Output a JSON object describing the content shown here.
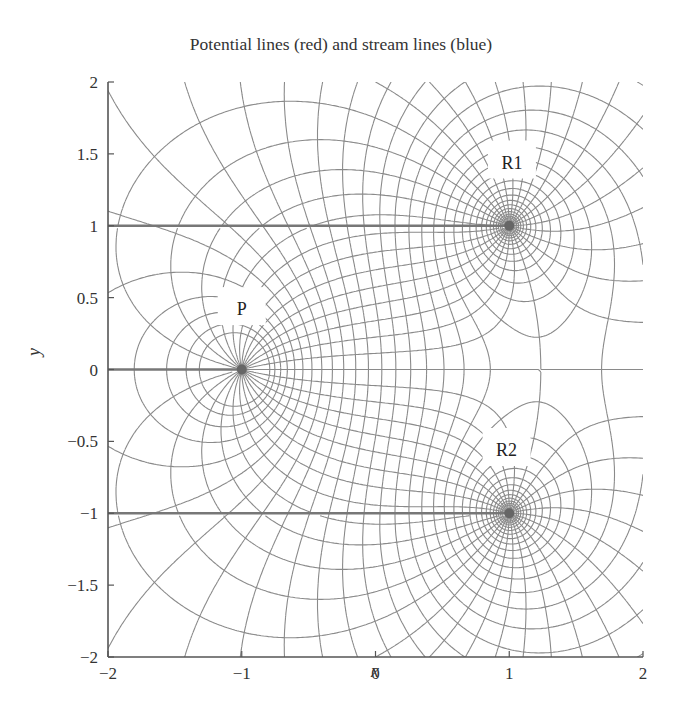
{
  "chart_data": {
    "type": "contour",
    "title": "Potential lines (red) and stream lines (blue)",
    "xlabel": "x",
    "ylabel": "y",
    "xlim": [
      -2,
      2
    ],
    "ylim": [
      -2,
      2
    ],
    "xticks": [
      -2,
      -1,
      0,
      1,
      2
    ],
    "xtick_labels": [
      "−2",
      "−1",
      "0",
      "1",
      "2"
    ],
    "yticks": [
      -2,
      -1.5,
      -1,
      -0.5,
      0,
      0.5,
      1,
      1.5,
      2
    ],
    "ytick_labels": [
      "−2",
      "−1.5",
      "−1",
      "−0.5",
      "0",
      "0.5",
      "1",
      "1.5",
      "2"
    ],
    "grid": false,
    "legend": null,
    "series": [
      {
        "name": "Potential lines",
        "color": "#c0392b",
        "rendered_color": "#8a8a8a"
      },
      {
        "name": "Stream lines",
        "color": "#2e5fb0",
        "rendered_color": "#8a8a8a"
      }
    ],
    "singularities": [
      {
        "label": "P",
        "x": -1,
        "y": 0,
        "type": "source",
        "label_x": -1.0,
        "label_y": 0.42
      },
      {
        "label": "R1",
        "x": 1,
        "y": 1,
        "type": "sink",
        "label_x": 1.02,
        "label_y": 1.44
      },
      {
        "label": "R2",
        "x": 1,
        "y": -1,
        "type": "sink",
        "label_x": 0.98,
        "label_y": -0.56
      }
    ],
    "branch_cuts": [
      {
        "from": [
          -2,
          1
        ],
        "to": [
          1,
          1
        ]
      },
      {
        "from": [
          -2,
          0
        ],
        "to": [
          -1,
          0
        ]
      },
      {
        "from": [
          -2,
          -1
        ],
        "to": [
          1,
          -1
        ]
      }
    ],
    "annotations": [
      "P",
      "R1",
      "R2"
    ]
  },
  "title": "Potential lines (red) and stream lines (blue)",
  "axes": {
    "x_label": "x",
    "y_label": "y"
  }
}
